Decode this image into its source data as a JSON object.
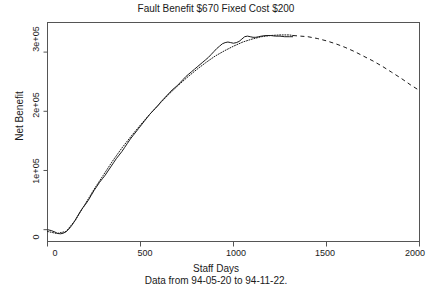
{
  "chart_data": {
    "type": "line",
    "title": "Fault Benefit $670 Fixed Cost $200",
    "xlabel": "Staff Days",
    "ylabel": "Net Benefit",
    "subtitle": "Data from 94-05-20 to 94-11-22.",
    "xlim": [
      0,
      2000
    ],
    "ylim": [
      -20000,
      350000
    ],
    "grid": false,
    "legend": "none",
    "xticks": [
      0,
      500,
      1000,
      1500,
      2000
    ],
    "xtick_labels": [
      "0",
      "500",
      "1000",
      "1500",
      "2000"
    ],
    "yticks": [
      0,
      100000,
      200000,
      300000
    ],
    "ytick_labels": [
      "0",
      "1e+05",
      "2e+05",
      "3e+05"
    ],
    "series": [
      {
        "name": "observed-net-benefit",
        "style": "solid",
        "color": "#1a1a1a",
        "x": [
          0,
          20,
          40,
          55,
          70,
          85,
          100,
          115,
          130,
          145,
          160,
          175,
          190,
          205,
          220,
          235,
          250,
          265,
          280,
          295,
          310,
          325,
          340,
          355,
          370,
          385,
          400,
          415,
          430,
          445,
          460,
          475,
          490,
          505,
          520,
          535,
          550,
          565,
          580,
          595,
          610,
          625,
          640,
          655,
          670,
          685,
          700,
          715,
          730,
          745,
          760,
          775,
          790,
          805,
          820,
          835,
          850,
          865,
          880,
          895,
          910,
          925,
          940,
          955,
          970,
          985,
          1000,
          1015,
          1030,
          1045,
          1060,
          1075,
          1090,
          1105,
          1120,
          1135,
          1150,
          1175,
          1200,
          1225,
          1250,
          1275,
          1300,
          1320
        ],
        "y": [
          0,
          -1500,
          -4000,
          -6500,
          -7000,
          -6000,
          -3500,
          1000,
          7000,
          14000,
          22000,
          30000,
          37000,
          43000,
          50000,
          58000,
          66000,
          73000,
          80000,
          86000,
          92000,
          99000,
          106000,
          113000,
          120000,
          126000,
          132000,
          139000,
          146000,
          153000,
          159000,
          165000,
          171000,
          177000,
          183000,
          189000,
          195000,
          200000,
          205000,
          210000,
          216000,
          221000,
          226000,
          231000,
          236000,
          240000,
          244000,
          249000,
          254000,
          259000,
          263000,
          267000,
          271000,
          275000,
          279000,
          283000,
          287000,
          291000,
          296000,
          301000,
          306000,
          310000,
          314000,
          316000,
          317000,
          316000,
          315000,
          316000,
          318000,
          322000,
          326000,
          327000,
          326000,
          325000,
          325000,
          326000,
          327000,
          328000,
          328000,
          327000,
          327000,
          326000,
          326000,
          326000
        ]
      },
      {
        "name": "fitted-model-in-sample",
        "style": "dotted",
        "color": "#1a1a1a",
        "x": [
          0,
          50,
          100,
          150,
          200,
          250,
          300,
          350,
          400,
          450,
          500,
          550,
          600,
          650,
          700,
          750,
          800,
          850,
          900,
          950,
          1000,
          1050,
          1100,
          1150,
          1200,
          1250,
          1300,
          1320
        ],
        "y": [
          -3000,
          -6500,
          -3000,
          16000,
          42000,
          68000,
          92000,
          116000,
          138000,
          158000,
          177000,
          195000,
          212000,
          228000,
          243000,
          257000,
          270000,
          282000,
          293000,
          302000,
          310000,
          317000,
          322000,
          326000,
          328000,
          329000,
          329000,
          328000
        ]
      },
      {
        "name": "projected-model-out-of-sample",
        "style": "dashed",
        "color": "#1a1a1a",
        "x": [
          1320,
          1400,
          1450,
          1500,
          1550,
          1600,
          1650,
          1700,
          1750,
          1800,
          1850,
          1900,
          1950,
          1990
        ],
        "y": [
          328000,
          326000,
          323000,
          319000,
          314000,
          308000,
          301000,
          293000,
          285000,
          276000,
          266000,
          256000,
          245000,
          237000
        ]
      }
    ]
  }
}
